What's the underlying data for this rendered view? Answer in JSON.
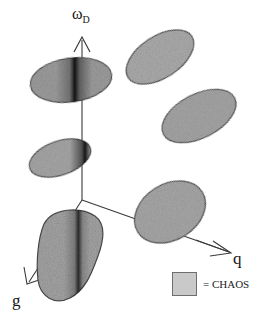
{
  "figure": {
    "background_color": "#ffffff",
    "ink_color": "#2b2b2b",
    "blob_fill_color": "#a9a9a9",
    "blob_edge_color": "#4a4a4a",
    "dark_band_color": "#151515"
  },
  "axes": [
    {
      "id": "omega-d",
      "label_base": "ω",
      "label_sub": "D",
      "direction": "up",
      "origin": [
        82,
        200
      ],
      "tip": [
        82,
        37
      ],
      "arrow": true
    },
    {
      "id": "q",
      "label": "q",
      "direction": "down-right",
      "origin": [
        82,
        200
      ],
      "tip": [
        231,
        253
      ],
      "arrow": true
    },
    {
      "id": "g",
      "label": "g",
      "direction": "down-left",
      "origin": [
        82,
        200
      ],
      "tip": [
        27,
        284
      ],
      "arrow": true
    }
  ],
  "blobs": [
    {
      "name": "chaos-region-upper-left",
      "cx": 71,
      "cy": 80,
      "rx": 41,
      "ry": 22,
      "rotation": -8,
      "dark_band": {
        "present": true,
        "center_x_frac": 0.62,
        "width_frac": 0.17
      },
      "shape": "ellipse"
    },
    {
      "name": "chaos-region-upper-right",
      "cx": 160,
      "cy": 57,
      "rx": 38,
      "ry": 21,
      "rotation": -33,
      "dark_band": {
        "present": false
      },
      "shape": "ellipse"
    },
    {
      "name": "chaos-region-middle-right",
      "cx": 199,
      "cy": 116,
      "rx": 40,
      "ry": 22,
      "rotation": -27,
      "dark_band": {
        "present": false
      },
      "shape": "ellipse"
    },
    {
      "name": "chaos-region-middle-left",
      "cx": 60,
      "cy": 158,
      "rx": 32,
      "ry": 17,
      "rotation": -19,
      "dark_band": {
        "present": true,
        "center_x_frac": 0.88,
        "width_frac": 0.13
      },
      "shape": "ellipse"
    },
    {
      "name": "chaos-region-lower-right",
      "cx": 170,
      "cy": 212,
      "rx": 38,
      "ry": 28,
      "rotation": -32,
      "dark_band": {
        "present": false
      },
      "shape": "ellipse"
    },
    {
      "name": "chaos-region-lower-left",
      "cx": 70,
      "cy": 255,
      "rx": 34,
      "ry": 44,
      "rotation": -12,
      "dark_band": {
        "present": true,
        "center_x_frac": 0.63,
        "width_frac": 0.14
      },
      "shape": "blob"
    }
  ],
  "legend": {
    "swatch_name": "chaos-swatch",
    "swatch_color": "#c9c9c9",
    "text": "= CHAOS"
  }
}
